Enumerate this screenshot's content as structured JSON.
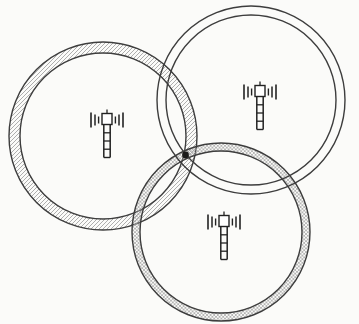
{
  "figure": {
    "canvas": {
      "width": 359,
      "height": 324,
      "background": "#fbfbf9"
    }
  },
  "style": {
    "circle_stroke": "#3d3d3d",
    "circle_stroke_width": 1.4,
    "tower_stroke": "#222222",
    "hatch_color": "#9b9b9b",
    "crosshatch_color": "#a0a0a0",
    "dot_color": "#1a1a1a"
  },
  "cells": [
    {
      "name": "cell-left",
      "cx": 103,
      "cy": 136,
      "r_outer": 94,
      "r_inner": 83,
      "ring_pattern": "diagonal-hatch"
    },
    {
      "name": "cell-bottom",
      "cx": 221,
      "cy": 232,
      "r_outer": 89,
      "r_inner": 81,
      "ring_pattern": "cross-hatch"
    },
    {
      "name": "cell-top-right",
      "cx": 251,
      "cy": 100,
      "r_outer": 94,
      "r_inner": 85,
      "ring_pattern": "none"
    }
  ],
  "towers": [
    {
      "name": "base-station-left",
      "x": 90,
      "y": 108
    },
    {
      "name": "base-station-top-right",
      "x": 243,
      "y": 80
    },
    {
      "name": "base-station-bottom",
      "x": 207,
      "y": 210
    }
  ],
  "marker": {
    "name": "intersection-point",
    "cx": 185.5,
    "cy": 155,
    "r": 3.4
  }
}
